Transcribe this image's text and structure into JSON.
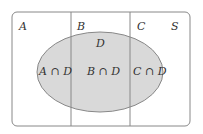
{
  "diagram": {
    "type": "venn",
    "universe_label": "S",
    "partition_labels": [
      "A",
      "B",
      "C"
    ],
    "set_label": "D",
    "intersections": [
      "A ∩ D",
      "B ∩ D",
      "C ∩ D"
    ],
    "colors": {
      "frame": "#888888",
      "ellipse_fill": "#d9d9d9",
      "ellipse_stroke": "#888888",
      "text": "#333333"
    }
  }
}
